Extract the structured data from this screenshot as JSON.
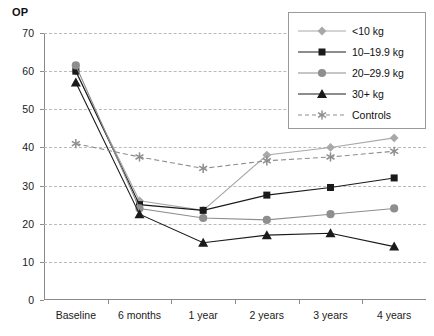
{
  "chart_data": {
    "type": "line",
    "title": "OP",
    "xlabel": "",
    "ylabel": "",
    "ylim": [
      0,
      70
    ],
    "yticks": [
      0,
      10,
      20,
      30,
      40,
      50,
      60,
      70
    ],
    "grid": true,
    "legend_position": "top-right",
    "categories": [
      "Baseline",
      "6 months",
      "1 year",
      "2 years",
      "3 years",
      "4 years"
    ],
    "series": [
      {
        "name": "<10 kg",
        "marker": "diamond",
        "color": "#a8a8a8",
        "linestyle": "solid",
        "values": [
          60,
          26,
          23.5,
          38,
          40,
          42.5
        ]
      },
      {
        "name": "10–19.9 kg",
        "marker": "square",
        "color": "#1a1a1a",
        "linestyle": "solid",
        "values": [
          60,
          25,
          23.5,
          27.5,
          29.5,
          32
        ]
      },
      {
        "name": "20–29.9 kg",
        "marker": "circle",
        "color": "#8e8e8e",
        "linestyle": "solid",
        "values": [
          61.5,
          24,
          21.5,
          21,
          22.5,
          24
        ]
      },
      {
        "name": "30+ kg",
        "marker": "triangle",
        "color": "#1a1a1a",
        "linestyle": "solid",
        "values": [
          57,
          22.5,
          15,
          17,
          17.5,
          14
        ]
      },
      {
        "name": "Controls",
        "marker": "asterisk",
        "color": "#8e8e8e",
        "linestyle": "dashed",
        "values": [
          41,
          37.5,
          34.5,
          36.5,
          37.5,
          39
        ]
      }
    ]
  },
  "legend": {
    "items": [
      {
        "label": "<10 kg"
      },
      {
        "label": "10–19.9 kg"
      },
      {
        "label": "20–29.9 kg"
      },
      {
        "label": "30+ kg"
      },
      {
        "label": "Controls"
      }
    ]
  }
}
